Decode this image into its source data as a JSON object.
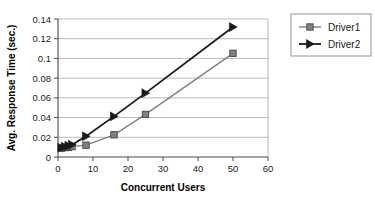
{
  "chart_data": {
    "type": "line",
    "title": "",
    "xlabel": "Concurrent Users",
    "ylabel": "Avg. Response Time (sec.)",
    "xlim": [
      0,
      60
    ],
    "ylim": [
      0,
      0.14
    ],
    "xticks": [
      "0",
      "10",
      "20",
      "30",
      "40",
      "50",
      "60"
    ],
    "xtick_values": [
      0,
      10,
      20,
      30,
      40,
      50,
      60
    ],
    "yticks": [
      "0",
      "0.02",
      "0.04",
      "0.06",
      "0.08",
      "0.1",
      "0.12",
      "0.14"
    ],
    "ytick_values": [
      0,
      0.02,
      0.04,
      0.06,
      0.08,
      0.1,
      0.12,
      0.14
    ],
    "grid": true,
    "grid_axis": "y",
    "legend_position": "right",
    "series": [
      {
        "name": "Driver1",
        "color": "#808080",
        "marker": "square",
        "x": [
          1,
          2,
          3,
          4,
          8,
          16,
          25,
          50
        ],
        "values": [
          0.009,
          0.0095,
          0.01,
          0.0105,
          0.012,
          0.0225,
          0.0432,
          0.1052
        ]
      },
      {
        "name": "Driver2",
        "color": "#1a1a1a",
        "marker": "triangle",
        "x": [
          1,
          2,
          3,
          4,
          8,
          16,
          25,
          50
        ],
        "values": [
          0.0095,
          0.0105,
          0.0115,
          0.0125,
          0.021,
          0.0412,
          0.0648,
          0.1318
        ]
      }
    ]
  },
  "legend": {
    "entries": [
      {
        "label": "Driver1"
      },
      {
        "label": "Driver2"
      }
    ]
  }
}
